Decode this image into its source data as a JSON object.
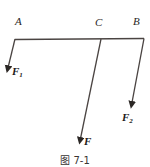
{
  "figure": {
    "caption": "图 7-1",
    "background_color": "#ffffff",
    "line_color": "#3a3533",
    "labels": {
      "point_a": "A",
      "point_c": "C",
      "point_b": "B",
      "force_1_base": "F",
      "force_1_sub": "1",
      "force_main": "F",
      "force_2_base": "F",
      "force_2_sub": "2"
    },
    "geometry": {
      "beam": {
        "x1": 15,
        "y1": 39,
        "x2": 144,
        "y2": 38
      },
      "arrow_f1": {
        "x1": 15,
        "y1": 39,
        "x2": 7,
        "y2": 71
      },
      "arrow_f": {
        "x1": 101,
        "y1": 39,
        "x2": 79,
        "y2": 144
      },
      "arrow_f2": {
        "x1": 144,
        "y1": 38,
        "x2": 131,
        "y2": 108
      }
    }
  }
}
